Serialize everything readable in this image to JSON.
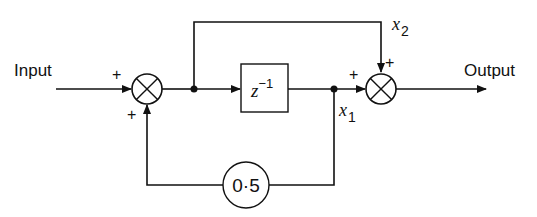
{
  "diagram": {
    "type": "block-diagram",
    "labels": {
      "input": "Input",
      "output": "Output",
      "delay_base": "z",
      "delay_exp": "−1",
      "gain": "0·5",
      "x1_base": "x",
      "x1_sub": "1",
      "x2_base": "x",
      "x2_sub": "2"
    },
    "signs": {
      "sum1_input": "+",
      "sum1_feedback": "+",
      "sum2_delay": "+",
      "sum2_bypass": "+"
    },
    "nodes": [
      {
        "id": "sum1",
        "kind": "summing-junction"
      },
      {
        "id": "delay",
        "kind": "unit-delay",
        "label": "z^-1"
      },
      {
        "id": "gain",
        "kind": "gain",
        "label": "0.5"
      },
      {
        "id": "sum2",
        "kind": "summing-junction"
      }
    ],
    "edges": [
      {
        "from": "Input",
        "to": "sum1",
        "sign": "+"
      },
      {
        "from": "sum1",
        "to": "delay"
      },
      {
        "from": "sum1",
        "to": "sum2",
        "label": "x2",
        "sign": "+"
      },
      {
        "from": "delay",
        "to": "sum2",
        "label": "x1",
        "sign": "+"
      },
      {
        "from": "delay",
        "to": "gain"
      },
      {
        "from": "gain",
        "to": "sum1",
        "sign": "+"
      },
      {
        "from": "sum2",
        "to": "Output"
      }
    ]
  }
}
